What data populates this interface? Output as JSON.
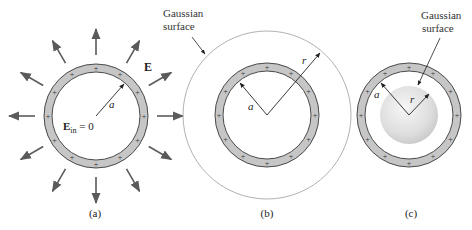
{
  "figure": {
    "panels": [
      {
        "id": "a",
        "label": "(a)",
        "center": [
          96,
          116
        ],
        "shell_outer_radius": 52,
        "shell_inner_radius": 44,
        "field_label": "E",
        "inside_field_label_main": "E",
        "inside_field_label_sub": "in",
        "inside_field_label_rest": " = 0",
        "radius_label": "a",
        "field_arrow_count": 12
      },
      {
        "id": "b",
        "label": "(b)",
        "center": [
          267,
          115
        ],
        "shell_outer_radius": 52,
        "shell_inner_radius": 44,
        "gaussian_radius": 84,
        "gaussian_label_line1": "Gaussian",
        "gaussian_label_line2": "surface",
        "radius_label_a": "a",
        "radius_label_r": "r"
      },
      {
        "id": "c",
        "label": "(c)",
        "center": [
          409,
          115
        ],
        "shell_outer_radius": 52,
        "shell_inner_radius": 44,
        "gaussian_radius": 29,
        "gaussian_label_line1": "Gaussian",
        "gaussian_label_line2": "surface",
        "radius_label_a": "a",
        "radius_label_r": "r"
      }
    ],
    "charge_symbol": "+",
    "charges_per_shell": 12,
    "colors": {
      "shell_fill": "#c6c6c6",
      "shell_stroke": "#4a4a4a",
      "arrow": "#5a5a5a",
      "gaussian_stroke": "#a8a8a8",
      "text": "#222222",
      "sphere_light": "#f4f4f4",
      "sphere_dark": "#cfcfcf"
    }
  }
}
